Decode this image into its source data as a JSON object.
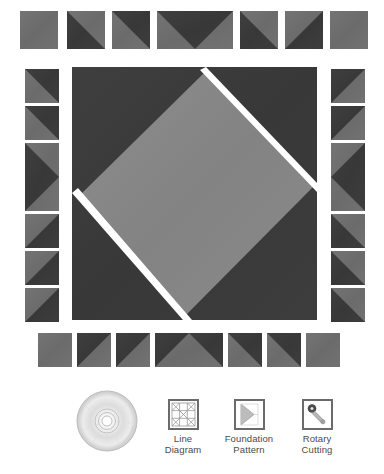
{
  "page": {
    "background": "#ffffff",
    "width": 384,
    "height": 474
  },
  "palette": {
    "dark": "#3b3b3b",
    "medium": "#6e6e6e",
    "light": "#8a8a8a",
    "seam": "#ffffff",
    "icon_frame": "#6b6b6b",
    "caption": "#4a4a4a"
  },
  "quilt": {
    "title": "quilt-block-cutting-diagram",
    "top_row": {
      "name": "top-border-strip",
      "pieces": [
        {
          "id": "t1",
          "type": "solid",
          "fill": "medium",
          "x": 20,
          "y": 11,
          "w": 38,
          "h": 38
        },
        {
          "id": "t2",
          "type": "hst-tl-dark",
          "x": 67,
          "y": 11,
          "w": 38,
          "h": 38
        },
        {
          "id": "t3",
          "type": "hst-tr-dark",
          "x": 112,
          "y": 11,
          "w": 38,
          "h": 38
        },
        {
          "id": "t4",
          "type": "flying-geese-down",
          "x": 157,
          "y": 11,
          "w": 76,
          "h": 38
        },
        {
          "id": "t5",
          "type": "hst-bl-dark",
          "x": 240,
          "y": 11,
          "w": 38,
          "h": 38
        },
        {
          "id": "t6",
          "type": "hst-br-dark",
          "x": 285,
          "y": 11,
          "w": 38,
          "h": 38
        },
        {
          "id": "t7",
          "type": "solid",
          "fill": "medium",
          "x": 330,
          "y": 11,
          "w": 38,
          "h": 38
        }
      ]
    },
    "left_column": {
      "name": "left-border-strip",
      "pieces": [
        {
          "id": "l1",
          "type": "hst-tr-dark",
          "x": 25,
          "y": 69,
          "w": 34,
          "h": 34
        },
        {
          "id": "l2",
          "type": "hst-tr-dark",
          "x": 25,
          "y": 106,
          "w": 34,
          "h": 34
        },
        {
          "id": "l3",
          "type": "flying-geese-right",
          "x": 25,
          "y": 143,
          "w": 34,
          "h": 68
        },
        {
          "id": "l4",
          "type": "hst-br-dark",
          "x": 25,
          "y": 214,
          "w": 34,
          "h": 34
        },
        {
          "id": "l5",
          "type": "hst-br-dark",
          "x": 25,
          "y": 251,
          "w": 34,
          "h": 34
        },
        {
          "id": "l6",
          "type": "solid",
          "fill": "medium",
          "x": 25,
          "y": 288,
          "w": 34,
          "h": 34
        }
      ]
    },
    "right_column": {
      "name": "right-border-strip",
      "pieces": [
        {
          "id": "r1",
          "type": "hst-tl-dark",
          "x": 331,
          "y": 69,
          "w": 34,
          "h": 34
        },
        {
          "id": "r2",
          "type": "hst-tl-dark",
          "x": 331,
          "y": 106,
          "w": 34,
          "h": 34
        },
        {
          "id": "r3",
          "type": "flying-geese-left",
          "x": 331,
          "y": 143,
          "w": 34,
          "h": 68
        },
        {
          "id": "r4",
          "type": "hst-bl-dark",
          "x": 331,
          "y": 214,
          "w": 34,
          "h": 34
        },
        {
          "id": "r5",
          "type": "hst-bl-dark",
          "x": 331,
          "y": 251,
          "w": 34,
          "h": 34
        },
        {
          "id": "r6",
          "type": "hst-bl-dark",
          "x": 331,
          "y": 288,
          "w": 34,
          "h": 34
        }
      ]
    },
    "center_block": {
      "name": "center-square-on-point",
      "x": 72,
      "y": 67,
      "w": 245,
      "h": 253,
      "description": "dark square with light square-on-point centre and white seam allowances"
    },
    "bottom_row": {
      "name": "bottom-border-strip",
      "pieces": [
        {
          "id": "b1",
          "type": "solid",
          "fill": "medium",
          "x": 38,
          "y": 333,
          "w": 34,
          "h": 34
        },
        {
          "id": "b2",
          "type": "hst-tl-dark",
          "x": 77,
          "y": 333,
          "w": 34,
          "h": 34
        },
        {
          "id": "b3",
          "type": "hst-tl-dark",
          "x": 116,
          "y": 333,
          "w": 34,
          "h": 34
        },
        {
          "id": "b4",
          "type": "flying-geese-up",
          "x": 155,
          "y": 333,
          "w": 68,
          "h": 34
        },
        {
          "id": "b5",
          "type": "hst-tr-dark",
          "x": 228,
          "y": 333,
          "w": 34,
          "h": 34
        },
        {
          "id": "b6",
          "type": "hst-tr-dark",
          "x": 267,
          "y": 333,
          "w": 34,
          "h": 34
        },
        {
          "id": "b7",
          "type": "solid",
          "fill": "medium",
          "x": 306,
          "y": 333,
          "w": 34,
          "h": 34
        }
      ]
    }
  },
  "toolbar": {
    "name": "resource-icons",
    "items": [
      {
        "id": "disc",
        "icon": "cd-disc-icon",
        "label": "",
        "label_line1": "",
        "label_line2": "",
        "x": 76,
        "y": 396,
        "has_frame": false
      },
      {
        "id": "line-diagram",
        "icon": "line-diagram-icon",
        "label": "Line Diagram",
        "label_line1": "Line",
        "label_line2": "Diagram",
        "x": 166,
        "y": 399,
        "has_frame": true
      },
      {
        "id": "foundation-pattern",
        "icon": "foundation-pattern-icon",
        "label": "Foundation Pattern",
        "label_line1": "Foundation",
        "label_line2": "Pattern",
        "x": 228,
        "y": 399,
        "has_frame": true
      },
      {
        "id": "rotary-cutting",
        "icon": "rotary-cutter-icon",
        "label": "Rotary Cutting",
        "label_line1": "Rotary",
        "label_line2": "Cutting",
        "x": 298,
        "y": 399,
        "has_frame": true
      }
    ]
  }
}
